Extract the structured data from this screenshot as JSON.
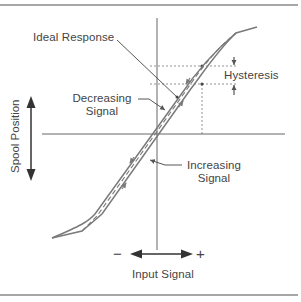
{
  "diagram": {
    "type": "hysteresis-curve",
    "axes": {
      "x_label": "Input Signal",
      "y_label": "Spool Position",
      "x_negative_sign": "−",
      "x_positive_sign": "+"
    },
    "labels": {
      "ideal_response": "Ideal Response",
      "decreasing_signal_line1": "Decreasing",
      "decreasing_signal_line2": "Signal",
      "increasing_signal_line1": "Increasing",
      "increasing_signal_line2": "Signal",
      "hysteresis": "Hysteresis"
    },
    "colors": {
      "curve": "#7a7a7a",
      "axis": "#666666",
      "text": "#444444",
      "border": "#888888"
    }
  }
}
